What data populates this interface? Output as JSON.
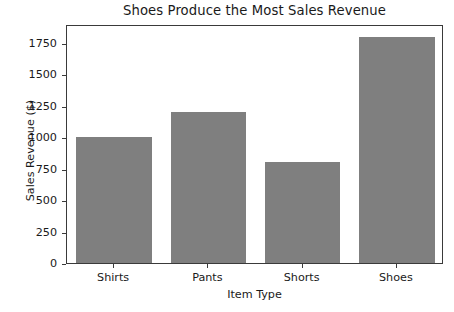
{
  "chart_data": {
    "type": "bar",
    "title": "Shoes Produce the Most Sales Revenue",
    "xlabel": "Item Type",
    "ylabel": "Sales Revenue ($)",
    "categories": [
      "Shirts",
      "Pants",
      "Shorts",
      "Shoes"
    ],
    "values": [
      1000,
      1200,
      800,
      1800
    ],
    "ylim": [
      0,
      1900
    ],
    "yticks": [
      0,
      250,
      500,
      750,
      1000,
      1250,
      1500,
      1750
    ],
    "ytick_labels": [
      "0",
      "250",
      "500",
      "750",
      "1000",
      "1250",
      "1500",
      "1750"
    ],
    "grid": false,
    "legend": null,
    "bar_color": "#7f7f7f",
    "bar_width_fraction": 0.8,
    "background_color": "#ffffff",
    "axis_color": "#3a3a3a"
  }
}
